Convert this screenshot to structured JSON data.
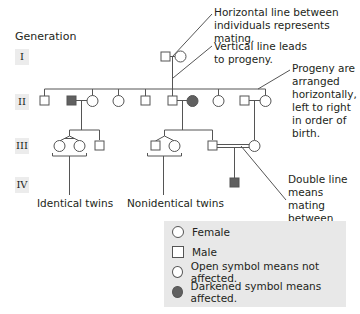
{
  "header": {
    "generation_title": "Generation"
  },
  "generations": [
    {
      "label": "I",
      "top": 49
    },
    {
      "label": "II",
      "top": 94
    },
    {
      "label": "III",
      "top": 138
    },
    {
      "label": "IV",
      "top": 177
    }
  ],
  "annotations": {
    "mating": "Horizontal line between individuals represents mating.",
    "mating_line1": "Horizontal line between",
    "mating_line2": "individuals represents mating.",
    "progeny_line1": "Vertical line leads",
    "progeny_line2": "to progeny.",
    "order_line1": "Progeny are",
    "order_line2": "arranged",
    "order_line3": "horizontally,",
    "order_line4": "left to right",
    "order_line5": "in order of",
    "order_line6": "birth.",
    "double_line1": "Double line means",
    "double_line2": "mating between",
    "double_line3": "relatives.",
    "identical_twins": "Identical twins",
    "nonidentical_twins": "Nonidentical twins"
  },
  "legend": {
    "female": "Female",
    "male": "Male",
    "unaffected": "Open symbol means not affected.",
    "affected": "Darkened symbol means affected."
  },
  "colors": {
    "line": "#555555",
    "affected_fill": "#606060",
    "legend_bg": "#e8e8e8",
    "gen_label_bg": "#ececec"
  },
  "pedigree": {
    "generation_I": [
      {
        "sex": "male",
        "affected": false
      },
      {
        "sex": "female",
        "affected": false
      }
    ],
    "generation_II": [
      {
        "sex": "male",
        "affected": false
      },
      {
        "sex": "male",
        "affected": true,
        "mate": "female",
        "mate_affected": false
      },
      {
        "sex": "female",
        "affected": false
      },
      {
        "sex": "male",
        "affected": false
      },
      {
        "sex": "male",
        "affected": false,
        "mate": "female",
        "mate_affected": true
      },
      {
        "sex": "female",
        "affected": false
      },
      {
        "sex": "male",
        "affected": false,
        "mate": "female",
        "mate_affected": false
      }
    ],
    "generation_III": [
      {
        "sex": "female",
        "affected": false,
        "twin": "identical"
      },
      {
        "sex": "female",
        "affected": false,
        "twin": "identical"
      },
      {
        "sex": "male",
        "affected": false
      },
      {
        "sex": "male",
        "affected": false,
        "twin": "nonidentical"
      },
      {
        "sex": "female",
        "affected": false,
        "twin": "nonidentical"
      },
      {
        "sex": "male",
        "affected": false,
        "consanguineous_mate": "female"
      }
    ],
    "generation_IV": [
      {
        "sex": "male",
        "affected": true
      }
    ]
  }
}
